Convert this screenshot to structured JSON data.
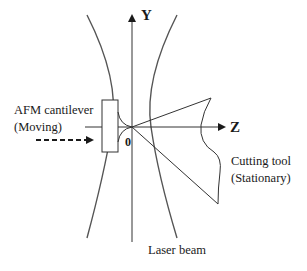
{
  "diagram": {
    "axes": {
      "y_label": "Y",
      "z_label": "Z",
      "origin_label": "0"
    },
    "labels": {
      "cantilever_line1": "AFM cantilever",
      "cantilever_line2": "(Moving)",
      "tool_line1": "Cutting tool",
      "tool_line2": "(Stationary)",
      "beam": "Laser beam"
    },
    "colors": {
      "line": "#2a2a2a",
      "beam": "#555555",
      "background": "#ffffff"
    }
  }
}
